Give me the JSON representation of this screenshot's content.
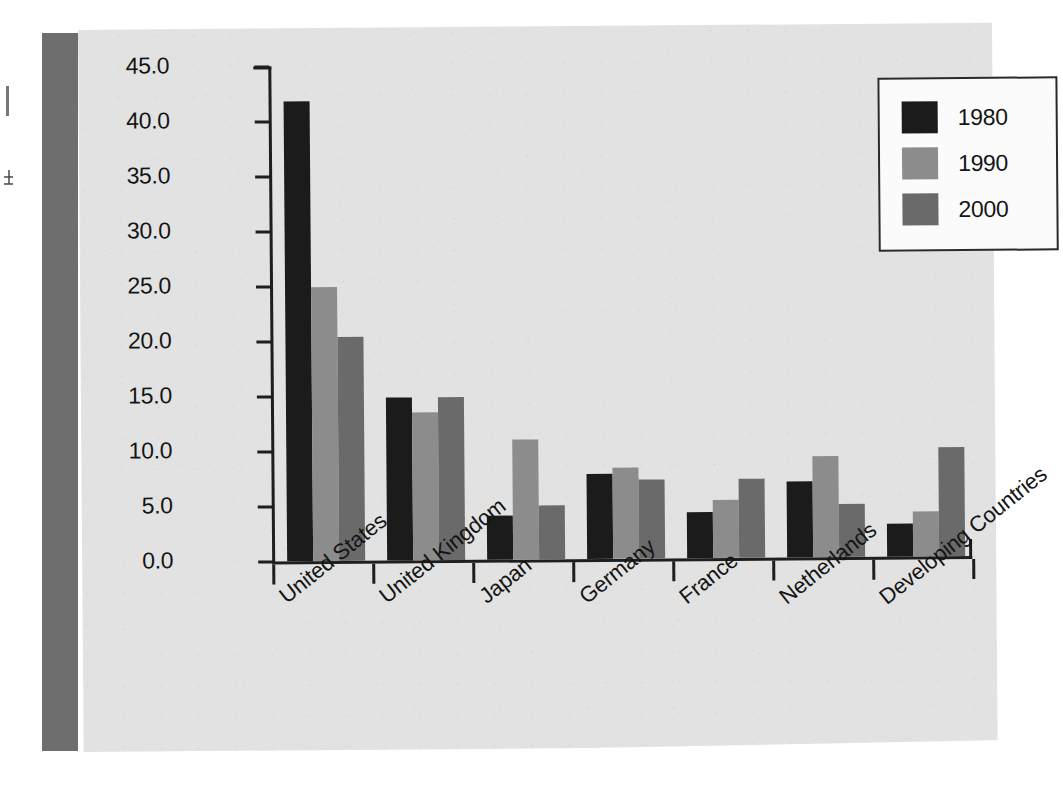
{
  "figure": {
    "background_color": "#e2e2e2",
    "spine_color": "#6e6e6e"
  },
  "legend": {
    "position": "top-right",
    "entries": [
      {
        "label": "1980",
        "color": "#1b1b1b"
      },
      {
        "label": "1990",
        "color": "#8c8c8c"
      },
      {
        "label": "2000",
        "color": "#6a6a6a"
      }
    ]
  },
  "axis": {
    "y_ticks": [
      "45.0",
      "40.0",
      "35.0",
      "30.0",
      "25.0",
      "20.0",
      "15.0",
      "10.0",
      "5.0",
      "0.0"
    ]
  },
  "chart_data": {
    "type": "bar",
    "title": "",
    "xlabel": "",
    "ylabel": "",
    "ylim": [
      0,
      45
    ],
    "ytick_step": 5,
    "grid": false,
    "legend_position": "top-right",
    "categories": [
      "United States",
      "United Kingdom",
      "Japan",
      "Germany",
      "France",
      "Netherlands",
      "Developing Countries"
    ],
    "series": [
      {
        "name": "1980",
        "color": "#1b1b1b",
        "values": [
          41.8,
          14.8,
          4.0,
          7.7,
          4.2,
          6.9,
          3.0
        ]
      },
      {
        "name": "1990",
        "color": "#8c8c8c",
        "values": [
          24.9,
          13.5,
          10.9,
          8.3,
          5.3,
          9.2,
          4.1
        ]
      },
      {
        "name": "2000",
        "color": "#6a6a6a",
        "values": [
          20.4,
          14.8,
          4.9,
          7.2,
          7.2,
          4.8,
          9.9
        ]
      }
    ]
  }
}
